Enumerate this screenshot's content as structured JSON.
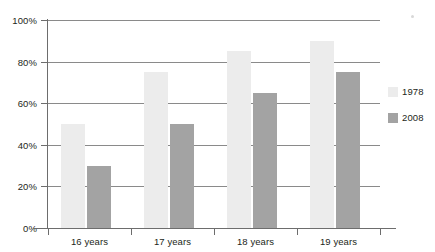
{
  "chart_data": {
    "type": "bar",
    "title": "",
    "subtitle": "",
    "xlabel": "",
    "ylabel": "",
    "categories": [
      "16 years",
      "17 years",
      "18 years",
      "19 years"
    ],
    "series": [
      {
        "name": "1978",
        "color": "#ececec",
        "values": [
          50,
          75,
          85,
          90
        ]
      },
      {
        "name": "2008",
        "color": "#a3a3a3",
        "values": [
          30,
          50,
          65,
          75
        ]
      }
    ],
    "ylim": [
      0,
      100
    ],
    "ytick_values": [
      0,
      20,
      40,
      60,
      80,
      100
    ],
    "ytick_labels": [
      "0%",
      "20%",
      "40%",
      "60%",
      "80%",
      "100%"
    ],
    "grid": true,
    "grid_axis": "y",
    "legend_position": "right",
    "annotations": []
  },
  "legend": {
    "entries": [
      {
        "label": "1978"
      },
      {
        "label": "2008"
      }
    ]
  }
}
